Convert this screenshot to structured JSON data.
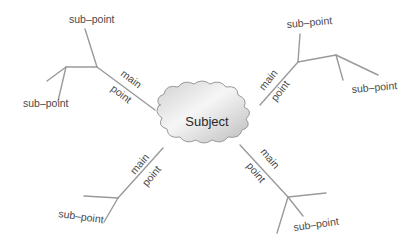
{
  "diagram": {
    "type": "mind-map",
    "center": {
      "label": "Subject"
    },
    "branches": [
      {
        "position": "upper-left",
        "main_label_1": "main",
        "main_label_2": "point",
        "sub_points": [
          "sub–point",
          "sub–point"
        ]
      },
      {
        "position": "upper-right",
        "main_label_1": "main",
        "main_label_2": "point",
        "sub_points": [
          "sub–point",
          "sub–point"
        ]
      },
      {
        "position": "lower-left",
        "main_label_1": "main",
        "main_label_2": "point",
        "sub_points": [
          "sub–point"
        ]
      },
      {
        "position": "lower-right",
        "main_label_1": "main",
        "main_label_2": "point",
        "sub_points": [
          "sub–point"
        ]
      }
    ]
  },
  "colors": {
    "line": "#9a9a9a",
    "cloud_light": "#f4f4f4",
    "cloud_dark": "#bdbdbd",
    "text": "#4a4a4a"
  }
}
